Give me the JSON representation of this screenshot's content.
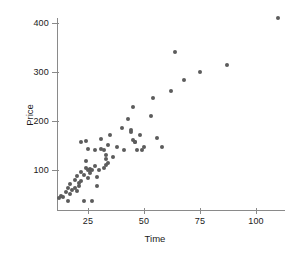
{
  "chart_data": {
    "type": "scatter",
    "title": "",
    "xlabel": "Time",
    "ylabel": "Price",
    "xlim": [
      10,
      112
    ],
    "ylim": [
      30,
      420
    ],
    "xticks": [
      25,
      50,
      75,
      100
    ],
    "yticks": [
      100,
      200,
      300,
      400
    ],
    "grid": false,
    "legend": null,
    "marker": {
      "shape": "circle",
      "color": "#5c5c5c",
      "size": 4
    },
    "series": [
      {
        "name": "observations",
        "points": [
          [
            12,
            42
          ],
          [
            13,
            47
          ],
          [
            14,
            44
          ],
          [
            15,
            55
          ],
          [
            16,
            63
          ],
          [
            16,
            37
          ],
          [
            17,
            52
          ],
          [
            17,
            72
          ],
          [
            18,
            60
          ],
          [
            19,
            80
          ],
          [
            19,
            64
          ],
          [
            20,
            58
          ],
          [
            20,
            88
          ],
          [
            21,
            68
          ],
          [
            21,
            74
          ],
          [
            22,
            157
          ],
          [
            22,
            96
          ],
          [
            22,
            78
          ],
          [
            23,
            37
          ],
          [
            23,
            90
          ],
          [
            24,
            105
          ],
          [
            24,
            118
          ],
          [
            24,
            160
          ],
          [
            25,
            100
          ],
          [
            25,
            142
          ],
          [
            25,
            84
          ],
          [
            26,
            103
          ],
          [
            26,
            101
          ],
          [
            26,
            93
          ],
          [
            27,
            36
          ],
          [
            27,
            100
          ],
          [
            28,
            108
          ],
          [
            28,
            141
          ],
          [
            29,
            86
          ],
          [
            29,
            68
          ],
          [
            30,
            99
          ],
          [
            31,
            142
          ],
          [
            31,
            163
          ],
          [
            32,
            104
          ],
          [
            32,
            141
          ],
          [
            33,
            110
          ],
          [
            33,
            122
          ],
          [
            33,
            130
          ],
          [
            34,
            115
          ],
          [
            34,
            152
          ],
          [
            35,
            172
          ],
          [
            36,
            127
          ],
          [
            38,
            146
          ],
          [
            40,
            186
          ],
          [
            41,
            141
          ],
          [
            43,
            204
          ],
          [
            44,
            182
          ],
          [
            44,
            178
          ],
          [
            45,
            162
          ],
          [
            45,
            228
          ],
          [
            46,
            158
          ],
          [
            46,
            157
          ],
          [
            47,
            140
          ],
          [
            48,
            172
          ],
          [
            49,
            140
          ],
          [
            50,
            146
          ],
          [
            53,
            211
          ],
          [
            54,
            246
          ],
          [
            56,
            166
          ],
          [
            58,
            147
          ],
          [
            62,
            262
          ],
          [
            64,
            340
          ],
          [
            68,
            283
          ],
          [
            75,
            299
          ],
          [
            87,
            315
          ],
          [
            110,
            411
          ]
        ]
      }
    ]
  },
  "axes": {
    "x_tick_labels": [
      "25",
      "50",
      "75",
      "100"
    ],
    "y_tick_labels": [
      "100",
      "200",
      "300",
      "400"
    ]
  }
}
